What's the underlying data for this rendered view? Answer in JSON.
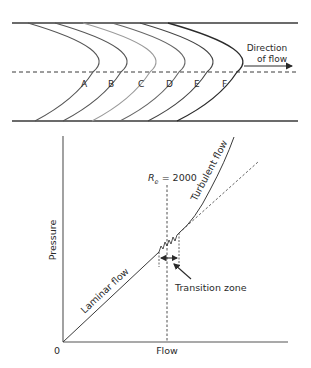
{
  "top_diagram": {
    "title": "Velocity profiles in a tube",
    "profile_labels": [
      "A",
      "B",
      "C",
      "D",
      "E",
      "F"
    ],
    "direction_label_line1": "Direction",
    "direction_label_line2": "of flow"
  },
  "bottom_chart": {
    "y_axis_label": "Pressure",
    "x_axis_label": "Flow",
    "origin_label": "0",
    "reynolds_label_symbol": "R",
    "reynolds_label_subscript": "e",
    "reynolds_label_value": " = 2000",
    "laminar_label": "Laminar flow",
    "turbulent_label": "Turbulent flow",
    "transition_label": "Transition zone"
  },
  "colors": {
    "line": "#3a3a3a",
    "profile_C": "#9a9a9a",
    "text": "#2a2a2a"
  }
}
